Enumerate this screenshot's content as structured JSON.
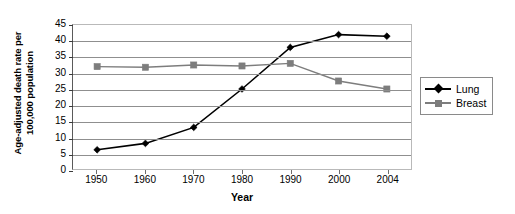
{
  "chart_data": {
    "type": "line",
    "title": "",
    "xlabel": "Year",
    "ylabel": "Age-adjusted death rate per 100,000 population",
    "ylabel_line1": "Age-adjusted death rate per",
    "ylabel_line2": "100,000 population",
    "categories": [
      "1950",
      "1960",
      "1970",
      "1980",
      "1990",
      "2000",
      "2004"
    ],
    "series": [
      {
        "name": "Lung",
        "values": [
          6,
          8,
          13,
          25,
          38,
          42,
          41.5
        ],
        "color": "#000000",
        "marker": "diamond"
      },
      {
        "name": "Breast",
        "values": [
          32,
          31.8,
          32.5,
          32.2,
          33,
          27.5,
          25
        ],
        "color": "#7d7d7d",
        "marker": "square"
      }
    ],
    "ylim": [
      0,
      45
    ],
    "yticks": [
      0,
      5,
      10,
      15,
      20,
      25,
      30,
      35,
      40,
      45
    ],
    "ytick_labels": [
      "0",
      "5",
      "10",
      "15",
      "20",
      "25",
      "30",
      "35",
      "40",
      "45"
    ],
    "grid": true,
    "grid_axis": "y",
    "legend_position": "right"
  },
  "legend": {
    "entries": [
      {
        "label": "Lung"
      },
      {
        "label": "Breast"
      }
    ]
  }
}
